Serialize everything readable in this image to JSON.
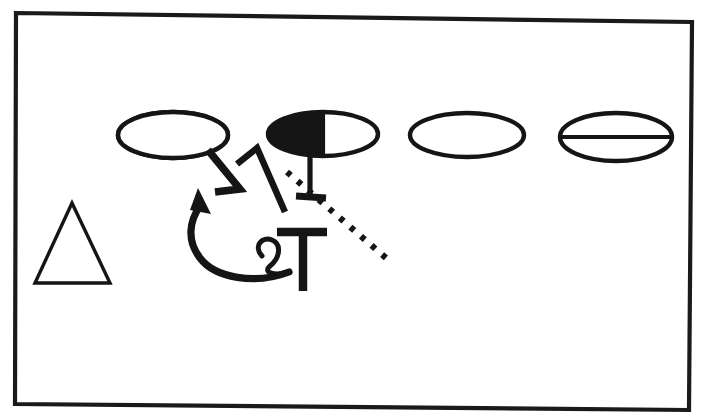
{
  "figure": {
    "background_color": "#ffffff",
    "ink_color": "#151515",
    "canvas": {
      "width": 707,
      "height": 419
    }
  },
  "frame": {
    "label": "Rectangular border frame",
    "points": "16,13 692,22 689,410 15,404",
    "stroke_color": "#1a1a1a",
    "stroke_width": 4.2
  },
  "shapes": {
    "ellipse_1": {
      "label": "Empty ellipse",
      "cx": 173,
      "cy": 135,
      "rx": 55,
      "ry": 23,
      "fill": "#ffffff",
      "state": "empty"
    },
    "ellipse_2": {
      "label": "Half-filled ellipse",
      "cx": 323,
      "cy": 134,
      "rx": 55,
      "ry": 22,
      "fill": "#ffffff",
      "fill_half": "#151515",
      "state": "half-filled-left"
    },
    "ellipse_3": {
      "label": "Empty ellipse",
      "cx": 467,
      "cy": 135,
      "rx": 57,
      "ry": 22,
      "fill": "#ffffff",
      "state": "empty"
    },
    "ellipse_4": {
      "label": "Bisected ellipse",
      "cx": 616,
      "cy": 137,
      "rx": 56,
      "ry": 24,
      "fill": "#ffffff",
      "state": "bisected-horizontal"
    },
    "triangle": {
      "label": "Open triangle",
      "points": "72,203 110,283 35,283",
      "fill": "#ffffff",
      "state": "empty"
    }
  },
  "annotations": {
    "connector_zigzag_left": {
      "label": "Zigzag connector from first ellipse",
      "path": "M 208,150 L 240,189 L 215,192"
    },
    "connector_zigzag_right": {
      "label": "Zigzag connector with peak",
      "path": "M 237,164 L 257,148 L 285,212"
    },
    "stem_under_ellipse_2": {
      "label": "Vertical stem below half-filled ellipse",
      "path": "M 310,156 L 310,197"
    },
    "tee_bar_small": {
      "label": "Small crossbar terminal",
      "path": "M 296,196 L 326,198"
    },
    "big_tee": {
      "label": "Large T glyph",
      "bar_path": "M 277,232 L 327,232",
      "stem_path": "M 303,232 L 303,291"
    },
    "curved_arrow": {
      "label": "Curved arrow pointing up-left",
      "path": "M 289,272 C 255,285 215,278 200,258 C 186,240 190,220 200,206",
      "arrowhead_points": "198,188 211,214 190,210"
    },
    "small_loop": {
      "label": "Small e-shaped loop",
      "path": "M 262,256 C 253,246 262,236 272,240 C 282,244 280,258 270,266 C 262,273 276,276 287,272"
    },
    "dotted_line": {
      "label": "Dotted diagonal line",
      "path": "M 287,172 L 386,258",
      "dash_pattern": "5 9"
    }
  }
}
